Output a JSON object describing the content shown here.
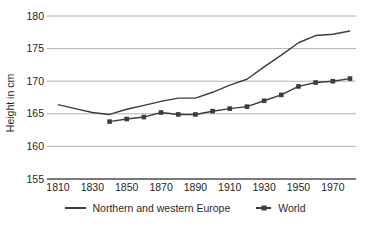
{
  "figure": {
    "ylabel": "Height in cm"
  },
  "chart_data": {
    "type": "line",
    "title": "",
    "xlabel": "",
    "ylabel": "Height in cm",
    "ylim": [
      155,
      180
    ],
    "xlim": [
      1810,
      1980
    ],
    "y_ticks": [
      180,
      175,
      170,
      165,
      160,
      155
    ],
    "x_ticks": [
      1810,
      1830,
      1850,
      1870,
      1890,
      1910,
      1930,
      1950,
      1970
    ],
    "grid": "horizontal-only",
    "legend_position": "bottom-center",
    "colors": {
      "series_line": "#3d3d3d",
      "gridline": "#ababab",
      "axis_line": "#4d4d4d",
      "text": "#1f1f1f"
    },
    "series": [
      {
        "name": "Northern and western Europe",
        "marker": "none",
        "color": "#3d3d3d",
        "x": [
          1810,
          1820,
          1830,
          1840,
          1850,
          1860,
          1870,
          1880,
          1890,
          1900,
          1910,
          1920,
          1930,
          1940,
          1950,
          1960,
          1970,
          1980
        ],
        "values": [
          166.4,
          165.8,
          165.2,
          164.9,
          165.7,
          166.3,
          166.9,
          167.4,
          167.4,
          168.3,
          169.4,
          170.3,
          172.2,
          174.0,
          175.9,
          177.0,
          177.2,
          177.7
        ]
      },
      {
        "name": "World",
        "marker": "square",
        "color": "#3d3d3d",
        "x": [
          1840,
          1850,
          1860,
          1870,
          1880,
          1890,
          1900,
          1910,
          1920,
          1930,
          1940,
          1950,
          1960,
          1970,
          1980
        ],
        "values": [
          163.8,
          164.2,
          164.5,
          165.2,
          164.9,
          164.9,
          165.4,
          165.8,
          166.1,
          167.0,
          167.9,
          169.2,
          169.8,
          170.0,
          170.4
        ]
      }
    ]
  }
}
